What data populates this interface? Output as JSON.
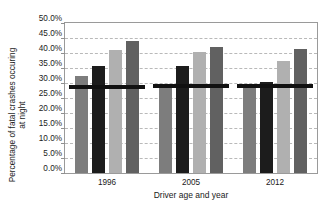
{
  "chart_data": {
    "type": "bar",
    "title": "",
    "xlabel": "Driver age and year",
    "ylabel_line1": "Percentage of fatal crashes occuring",
    "ylabel_line2": "at night",
    "categories": [
      "1996",
      "2005",
      "2012"
    ],
    "ylim": [
      0,
      50
    ],
    "ytick_step": 5,
    "ytick_labels": [
      "50.0%",
      "45.0%",
      "40.0%",
      "35.0%",
      "30.0%",
      "25.0%",
      "20.0%",
      "15.0%",
      "10.0%",
      "5.0%",
      "0.0%"
    ],
    "ytick_values": [
      50,
      45,
      40,
      35,
      30,
      25,
      20,
      15,
      10,
      5,
      0
    ],
    "grid": true,
    "grid_style": "dashed",
    "legend_position": "none",
    "series": [
      {
        "name": "series-1",
        "color": "#7d7d7d",
        "values": [
          32.3,
          29.5,
          29.6
        ]
      },
      {
        "name": "series-2",
        "color": "#1c1c1c",
        "values": [
          35.7,
          35.6,
          30.5
        ]
      },
      {
        "name": "series-3",
        "color": "#b0b0b0",
        "values": [
          41.0,
          40.2,
          37.3
        ]
      },
      {
        "name": "series-4",
        "color": "#616161",
        "values": [
          44.0,
          42.0,
          41.5
        ]
      }
    ],
    "reference_lines": [
      {
        "group": "1996",
        "value": 28.6,
        "color": "#111111"
      },
      {
        "group": "2005",
        "value": 28.9,
        "color": "#111111"
      },
      {
        "group": "2012",
        "value": 28.9,
        "color": "#111111"
      }
    ]
  }
}
